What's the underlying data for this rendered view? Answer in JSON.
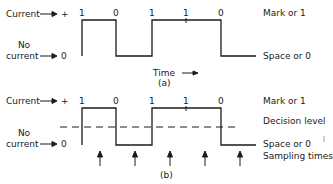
{
  "diagram": {
    "panel_a": {
      "caption": "(a)",
      "current_label": "Current",
      "current_symbol": "+",
      "no_current_label_line1": "No",
      "no_current_label_line2": "current",
      "zero_symbol": "0",
      "bits": [
        "1",
        "0",
        "1",
        "1",
        "0"
      ],
      "mark_label": "Mark or 1",
      "space_label": "Space or 0",
      "time_label": "Time"
    },
    "panel_b": {
      "caption": "(b)",
      "current_label": "Current",
      "current_symbol": "+",
      "no_current_label_line1": "No",
      "no_current_label_line2": "current",
      "zero_symbol": "0",
      "bits": [
        "1",
        "0",
        "1",
        "1",
        "0"
      ],
      "mark_label": "Mark or 1",
      "decision_label": "Decision level",
      "space_label": "Space or 0",
      "sampling_label": "Sampling times",
      "sampling_count": 5
    }
  }
}
